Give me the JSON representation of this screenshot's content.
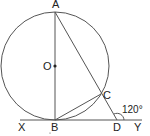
{
  "diagram": {
    "type": "geometry",
    "circle": {
      "center_label": "O",
      "cx": 55,
      "cy": 66,
      "r": 54
    },
    "points": {
      "A": {
        "label": "A",
        "x": 55,
        "y": 12
      },
      "O": {
        "label": "O",
        "x": 55,
        "y": 66
      },
      "B": {
        "label": "B",
        "x": 55,
        "y": 120
      },
      "C": {
        "label": "C",
        "x": 101,
        "y": 94
      },
      "D": {
        "label": "D",
        "x": 117,
        "y": 120
      },
      "X": {
        "label": "X",
        "x": 20,
        "y": 120
      },
      "Y": {
        "label": "Y",
        "x": 142,
        "y": 120
      }
    },
    "segments": [
      "AB",
      "AD",
      "BC",
      "XY"
    ],
    "angle": {
      "at": "D",
      "label": "120°",
      "between": [
        "DY",
        "DC-extended"
      ]
    }
  }
}
